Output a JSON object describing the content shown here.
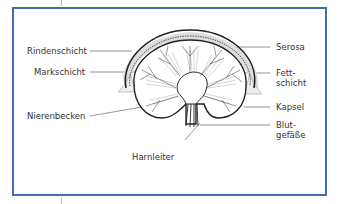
{
  "figure": {
    "labels_left": {
      "rindenschicht": "Rindenschicht",
      "markschicht": "Markschicht",
      "nierenbecken": "Nierenbecken"
    },
    "labels_right": {
      "serosa": "Serosa",
      "fettschicht_1": "Fett-",
      "fettschicht_2": "schicht",
      "kapsel": "Kapsel",
      "blutgefaesse_1": "Blut-",
      "blutgefaesse_2": "gefäße"
    },
    "labels_bottom": {
      "harnleiter": "Harnleiter"
    },
    "colors": {
      "frame_border": "#3f6fb0",
      "line": "#222222"
    }
  }
}
